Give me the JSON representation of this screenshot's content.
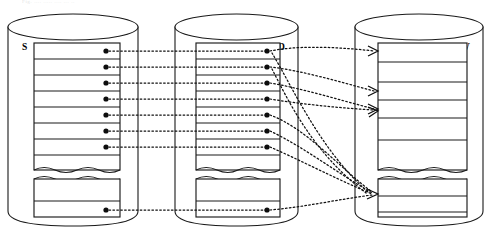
{
  "diagram": {
    "type": "database-mapping-diagram",
    "caption_fragment": "Fig. ....  ..... .... ... ..",
    "background_color": "#ffffff",
    "line_color": "#1a1a1a",
    "connector_color": "#111111",
    "cylinders": [
      {
        "id": "S",
        "label": "S",
        "label_position": "top-left-inside",
        "x": 8,
        "y": 14,
        "width": 130,
        "height": 212,
        "ellipse_ry": 13,
        "label_x": 22,
        "label_y": 48,
        "table": {
          "x": 34,
          "y": 43,
          "width": 86,
          "upper_block_height": 127,
          "upper_rows": 8,
          "lower_block_y": 179,
          "lower_block_height": 38,
          "lower_rows": 2,
          "connected_upper_rows": [
            1,
            2,
            3,
            4,
            5,
            6,
            7
          ],
          "connected_lower_rows": [
            2
          ],
          "dot_x": 106
        }
      },
      {
        "id": "D",
        "label": "D",
        "label_position": "top-right-inside",
        "x": 175,
        "y": 14,
        "width": 123,
        "height": 212,
        "ellipse_ry": 13,
        "label_x": 282,
        "label_y": 48,
        "table": {
          "x": 196,
          "y": 43,
          "width": 84,
          "upper_block_height": 127,
          "upper_rows": 8,
          "lower_block_y": 179,
          "lower_block_height": 38,
          "lower_rows": 2,
          "connected_upper_rows": [
            1,
            2,
            3,
            4,
            5,
            6,
            7
          ],
          "connected_lower_rows": [
            2
          ],
          "dot_x": 267
        }
      },
      {
        "id": "V",
        "label": "V",
        "label_position": "top-right-inside",
        "x": 355,
        "y": 14,
        "width": 128,
        "height": 212,
        "ellipse_ry": 13,
        "label_x": 466,
        "label_y": 48,
        "table": {
          "x": 378,
          "y": 43,
          "width": 89,
          "upper_block_height": 127,
          "upper_rows": 5,
          "lower_block_y": 179,
          "lower_block_height": 38,
          "lower_rows": 3,
          "arrow_target_rows": [
            1,
            3,
            4
          ],
          "arrow_x": 378
        }
      }
    ],
    "connections": {
      "s_to_d": {
        "style": "dotted-straight-horizontal",
        "count": 8,
        "description": "horizontal dotted links from each marked S row to the matching D row"
      },
      "d_to_v": {
        "style": "dotted-curved-arrow",
        "count": 8,
        "description": "curved dotted arrows from D rows converging onto V rows",
        "targets": [
          {
            "from_row": 1,
            "to_row": 1
          },
          {
            "from_row": 2,
            "to_row": 3
          },
          {
            "from_row": 3,
            "to_row": 4
          },
          {
            "from_row": 4,
            "to_row": 4
          },
          {
            "from_row": 5,
            "to_lower_row": 2
          },
          {
            "from_row": 6,
            "to_lower_row": 2
          },
          {
            "from_row": 7,
            "to_lower_row": 2
          },
          {
            "from_lower_row": 2,
            "to_lower_row": 2
          }
        ]
      }
    }
  }
}
